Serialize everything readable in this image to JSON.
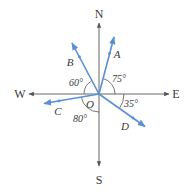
{
  "diagram": {
    "type": "compass-vector-diagram",
    "origin": {
      "label": "O",
      "x": 99,
      "y": 94
    },
    "colors": {
      "axis": "#555555",
      "vector": "#5b8fd6",
      "text": "#3a3a3a",
      "arc": "#555555"
    },
    "directions": [
      {
        "id": "N",
        "label": "N",
        "tip": [
          99,
          22
        ],
        "label_pos": [
          99,
          17
        ]
      },
      {
        "id": "S",
        "label": "S",
        "tip": [
          99,
          167
        ],
        "label_pos": [
          99,
          184
        ]
      },
      {
        "id": "W",
        "label": "W",
        "tip": [
          28,
          94
        ],
        "label_pos": [
          20,
          98
        ]
      },
      {
        "id": "E",
        "label": "E",
        "tip": [
          170,
          94
        ],
        "label_pos": [
          176,
          98
        ]
      }
    ],
    "vectors": [
      {
        "id": "A",
        "label": "A",
        "direction": "N15°E",
        "angle_label": "75°",
        "angle_from": "E",
        "tip": [
          114,
          36
        ],
        "label_pos": [
          117,
          58
        ]
      },
      {
        "id": "B",
        "label": "B",
        "direction": "N30°W",
        "angle_label": "60°",
        "angle_from": "W",
        "tip": [
          71,
          42
        ],
        "label_pos": [
          69,
          66
        ]
      },
      {
        "id": "C",
        "label": "C",
        "direction": "S80°W",
        "angle_label": "80°",
        "angle_from": "S",
        "tip": [
          43,
          104
        ],
        "label_pos": [
          57,
          115
        ]
      },
      {
        "id": "D",
        "label": "D",
        "direction": "S55°E",
        "angle_label": "35°",
        "angle_from": "E",
        "tip": [
          146,
          127
        ],
        "label_pos": [
          125,
          129
        ]
      }
    ],
    "angle_labels": [
      {
        "text": "60°",
        "pos": [
          70,
          86
        ]
      },
      {
        "text": "75°",
        "pos": [
          114,
          82
        ]
      },
      {
        "text": "35°",
        "pos": [
          125,
          107
        ]
      },
      {
        "text": "80°",
        "pos": [
          74,
          121
        ]
      }
    ]
  }
}
